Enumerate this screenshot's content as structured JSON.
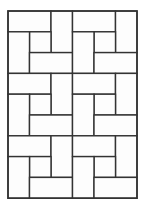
{
  "diagram": {
    "type": "pinwheel-tiling",
    "colors": {
      "line": "#333333",
      "fill": "#fdfdfd",
      "background": "#ffffff"
    },
    "grid": {
      "origin_x": 8,
      "origin_y": 11,
      "cols": 6,
      "rows": 9,
      "cell_w": 21.5,
      "cell_h": 20.8
    },
    "block": {
      "size_cells": 3,
      "pieces": [
        {
          "name": "top-horizontal-rect",
          "c": 0,
          "r": 0,
          "w": 2,
          "h": 1
        },
        {
          "name": "right-vertical-rect",
          "c": 2,
          "r": 0,
          "w": 1,
          "h": 2
        },
        {
          "name": "center-square",
          "c": 1,
          "r": 1,
          "w": 1,
          "h": 1
        },
        {
          "name": "left-vertical-rect",
          "c": 0,
          "r": 1,
          "w": 1,
          "h": 2
        },
        {
          "name": "bottom-horizontal-rect",
          "c": 1,
          "r": 2,
          "w": 2,
          "h": 1
        }
      ]
    },
    "blocks": [
      {
        "name": "block-r1-c1",
        "bc": 0,
        "br": 0
      },
      {
        "name": "block-r1-c2",
        "bc": 1,
        "br": 0
      },
      {
        "name": "block-r2-c1",
        "bc": 0,
        "br": 1
      },
      {
        "name": "block-r2-c2",
        "bc": 1,
        "br": 1
      },
      {
        "name": "block-r3-c1",
        "bc": 0,
        "br": 2
      },
      {
        "name": "block-r3-c2",
        "bc": 1,
        "br": 2
      }
    ]
  }
}
